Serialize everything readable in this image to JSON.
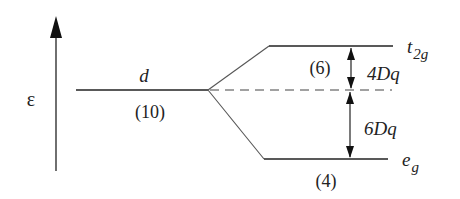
{
  "diagram": {
    "energy_axis": {
      "label": "ε",
      "direction": "up"
    },
    "levels": [
      {
        "id": "d",
        "label": "d",
        "degeneracy": "(10)"
      },
      {
        "id": "t2g",
        "label_main": "t",
        "label_sub": "2g",
        "degeneracy": "(6)",
        "shift": "4Dq"
      },
      {
        "id": "eg",
        "label_main": "e",
        "label_sub": "g",
        "degeneracy": "(4)",
        "shift": "6Dq"
      }
    ],
    "barycenter": {
      "style": "dashed"
    },
    "colors": {
      "line": "#222222",
      "dashed": "#444444",
      "background": "#ffffff"
    }
  }
}
